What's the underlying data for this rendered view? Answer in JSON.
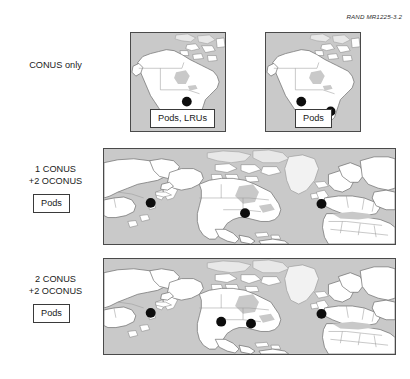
{
  "figure": {
    "credit": "RAND MR1225-3.2",
    "credit_icon": "none"
  },
  "rows": [
    {
      "id": "conus-only",
      "label_lines": [
        "CONUS only"
      ],
      "map_type": "north-america",
      "maps": [
        {
          "id": "na-left",
          "callout": "Pods, LRUs",
          "sites": [
            {
              "name": "central-conus",
              "x": 57.0,
              "y": 70.0,
              "r": 5.0
            }
          ]
        },
        {
          "id": "na-right",
          "callout": "Pods",
          "sites": [
            {
              "name": "western-conus",
              "x": 36.0,
              "y": 70.0,
              "r": 5.0
            },
            {
              "name": "eastern-conus",
              "x": 66.0,
              "y": 80.0,
              "r": 5.0
            }
          ]
        }
      ]
    },
    {
      "id": "one-conus-two-oconus",
      "label_lines": [
        "1 CONUS",
        "+2 OCONUS"
      ],
      "side_callout": "Pods",
      "map_type": "world",
      "maps": [
        {
          "id": "world-middle",
          "sites": [
            {
              "name": "east-asia",
              "x": 47.0,
              "y": 55.0,
              "r": 5.0
            },
            {
              "name": "central-conus",
              "x": 142.0,
              "y": 65.5,
              "r": 5.0
            },
            {
              "name": "western-europe",
              "x": 219.0,
              "y": 56.0,
              "r": 5.0
            }
          ]
        }
      ]
    },
    {
      "id": "two-conus-two-oconus",
      "label_lines": [
        "2 CONUS",
        "+2 OCONUS"
      ],
      "side_callout": "Pods",
      "map_type": "world",
      "maps": [
        {
          "id": "world-bottom",
          "sites": [
            {
              "name": "east-asia",
              "x": 47.0,
              "y": 55.0,
              "r": 5.0
            },
            {
              "name": "western-conus",
              "x": 118.0,
              "y": 64.0,
              "r": 5.0
            },
            {
              "name": "eastern-conus",
              "x": 148.0,
              "y": 66.0,
              "r": 5.0
            },
            {
              "name": "western-europe",
              "x": 219.0,
              "y": 56.0,
              "r": 5.0
            }
          ]
        }
      ]
    }
  ],
  "colors": {
    "ocean": "#c9c9c9",
    "land": "#ffffff",
    "site_dot": "#0d0d0d",
    "frame": "#4a4a4a",
    "text": "#1a1a1a",
    "page_background": "#ffffff"
  }
}
